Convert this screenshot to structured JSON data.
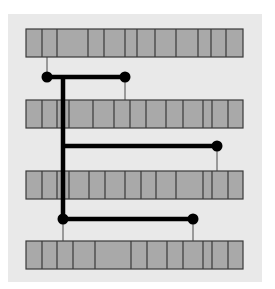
{
  "colors": {
    "page": "#ffffff",
    "panel": "#e9e9e9",
    "cell_fill": "#a9a9a9",
    "cell_stroke": "#3a3a3a",
    "connector": "#000000",
    "thin_line": "#4a4a4a"
  },
  "panel": {
    "x": 8,
    "y": 14,
    "w": 254,
    "h": 268
  },
  "rows": [
    {
      "id": "row-1",
      "x": 26,
      "y": 29,
      "w": 217,
      "h": 28,
      "dividers": [
        42,
        57,
        88,
        104,
        125,
        137,
        155,
        176,
        198,
        211,
        226
      ]
    },
    {
      "id": "row-2",
      "x": 26,
      "y": 100,
      "w": 217,
      "h": 28,
      "dividers": [
        42,
        57,
        69,
        93,
        114,
        130,
        146,
        166,
        183,
        203,
        212,
        228
      ]
    },
    {
      "id": "row-3",
      "x": 26,
      "y": 171,
      "w": 217,
      "h": 28,
      "dividers": [
        42,
        57,
        69,
        89,
        105,
        125,
        141,
        156,
        176,
        203,
        212,
        228
      ]
    },
    {
      "id": "row-4",
      "x": 26,
      "y": 241,
      "w": 217,
      "h": 28,
      "dividers": [
        42,
        57,
        73,
        95,
        131,
        147,
        167,
        183,
        203,
        212,
        228
      ]
    }
  ],
  "trunk": {
    "x": 63,
    "y1": 77,
    "y2": 219
  },
  "branches": [
    {
      "id": "branch-1",
      "y": 77,
      "x1": 47,
      "x2": 125,
      "nodes": [
        {
          "x": 47,
          "y": 77,
          "stub_to_y": 57
        },
        {
          "x": 125,
          "y": 77,
          "stub_to_y": 100
        }
      ]
    },
    {
      "id": "branch-2",
      "y": 146,
      "x1": 63,
      "x2": 217,
      "nodes": [
        {
          "x": 217,
          "y": 146,
          "stub_to_y": 171
        }
      ]
    },
    {
      "id": "branch-3",
      "y": 219,
      "x1": 63,
      "x2": 193,
      "nodes": [
        {
          "x": 63,
          "y": 219,
          "stub_to_y": 241
        },
        {
          "x": 193,
          "y": 219,
          "stub_to_y": 241
        }
      ]
    }
  ]
}
